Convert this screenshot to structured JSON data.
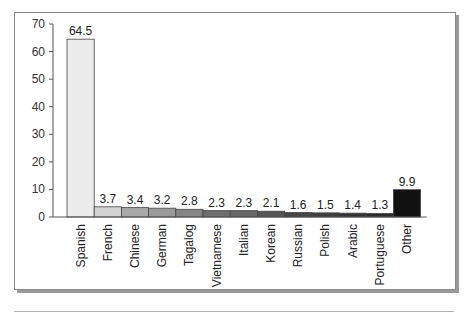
{
  "chart_data": {
    "type": "bar",
    "title": "",
    "xlabel": "",
    "ylabel": "",
    "ylim": [
      0,
      70
    ],
    "yticks": [
      0,
      10,
      20,
      30,
      40,
      50,
      60,
      70
    ],
    "grid": false,
    "legend": null,
    "categories": [
      "Spanish",
      "French",
      "Chinese",
      "German",
      "Tagalog",
      "Vietnamese",
      "Italian",
      "Korean",
      "Russian",
      "Polish",
      "Arabic",
      "Portuguese",
      "Other"
    ],
    "values": [
      64.5,
      3.7,
      3.4,
      3.2,
      2.8,
      2.3,
      2.3,
      2.1,
      1.6,
      1.5,
      1.4,
      1.3,
      9.9
    ],
    "value_labels": [
      "64.5",
      "3.7",
      "3.4",
      "3.2",
      "2.8",
      "2.3",
      "2.3",
      "2.1",
      "1.6",
      "1.5",
      "1.4",
      "1.3",
      "9.9"
    ],
    "bar_colors": [
      "#ececec",
      "#d2d2d2",
      "#a9a9a9",
      "#9a9a9a",
      "#858585",
      "#6f6f6f",
      "#686868",
      "#555555",
      "#454545",
      "#3e3e3e",
      "#333333",
      "#2b2b2b",
      "#111111"
    ]
  }
}
